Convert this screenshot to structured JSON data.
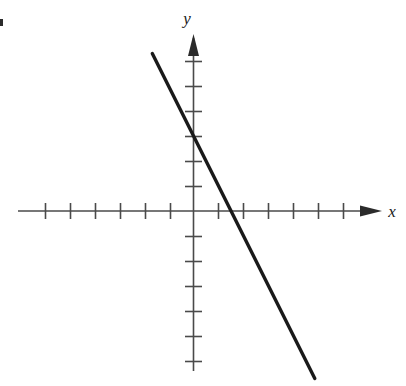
{
  "figure": {
    "background_color": "#ffffff",
    "axis_color": "#4a4a4a",
    "line_color": "#1a1a1a",
    "label_color": "#1a1a1a"
  },
  "labels": {
    "x_axis": "x",
    "y_axis": "y"
  },
  "icons": {
    "x_arrowhead": "arrow-right-icon",
    "y_arrowhead": "arrow-up-icon"
  },
  "chart_data": {
    "type": "line",
    "title": "",
    "xlabel": "x",
    "ylabel": "y",
    "grid": false,
    "legend": null,
    "xlim": [
      -7,
      7.4
    ],
    "ylim": [
      -7,
      7
    ],
    "x_ticks": [
      -6,
      -5,
      -4,
      -3,
      -2,
      -1,
      1,
      2,
      3,
      4,
      5,
      6
    ],
    "y_ticks": [
      -6,
      -5,
      -4,
      -3,
      -2,
      -1,
      1,
      2,
      3,
      4,
      5,
      6
    ],
    "tick_labels_shown": false,
    "axes_arrows": [
      "x-positive",
      "y-positive"
    ],
    "series": [
      {
        "name": "line",
        "equation": "y = -2x + 3",
        "slope": -2,
        "y_intercept": 3,
        "x_intercept": 1.5,
        "points": [
          {
            "x": -1.65,
            "y": 6.3
          },
          {
            "x": 0,
            "y": 3
          },
          {
            "x": 1.5,
            "y": 0
          },
          {
            "x": 4.85,
            "y": -6.7
          }
        ],
        "endpoints": {
          "start": {
            "x": -1.65,
            "y": 6.3
          },
          "end": {
            "x": 4.85,
            "y": -6.7
          }
        }
      }
    ]
  }
}
